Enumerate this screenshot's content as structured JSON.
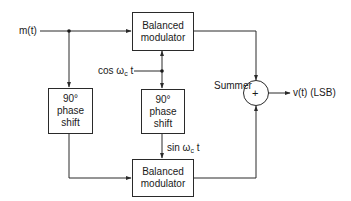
{
  "diagram": {
    "type": "block-diagram",
    "input": {
      "label": "m(t)"
    },
    "output": {
      "label": "v(t) (LSB)"
    },
    "carrier_cos": {
      "prefix": "cos ",
      "omega": "ω",
      "sub": "c",
      "suffix": " t"
    },
    "carrier_sin": {
      "prefix": "sin ",
      "omega": "ω",
      "sub": "c",
      "suffix": " t"
    },
    "blocks": {
      "top_modulator": {
        "line1": "Balanced",
        "line2": "modulator"
      },
      "bottom_modulator": {
        "line1": "Balanced",
        "line2": "modulator"
      },
      "left_phase_shift": {
        "line1": "90°",
        "line2": "phase",
        "line3": "shift"
      },
      "mid_phase_shift": {
        "line1": "90°",
        "line2": "phase",
        "line3": "shift"
      }
    },
    "summer": {
      "label": "Summer",
      "symbol": "+"
    },
    "colors": {
      "line": "#2a2a2a",
      "background": "#ffffff"
    }
  }
}
